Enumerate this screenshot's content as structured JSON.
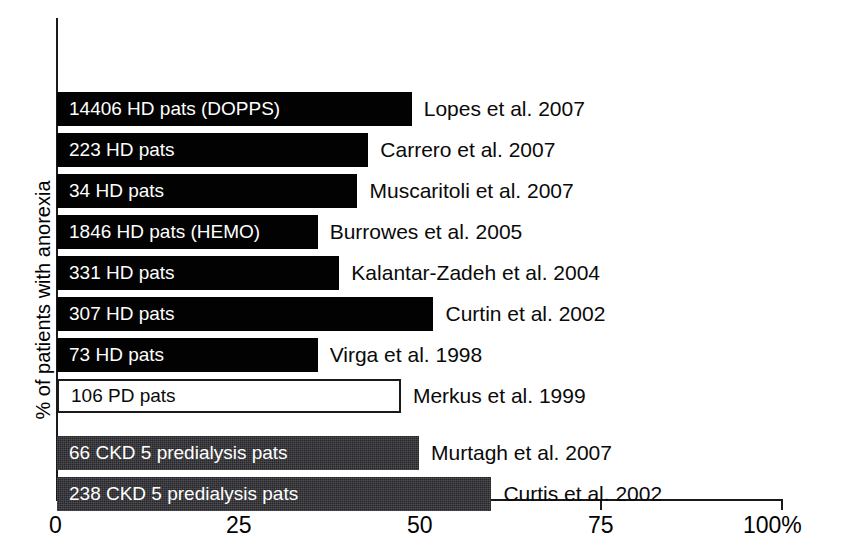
{
  "chart_data": {
    "type": "bar",
    "orientation": "horizontal",
    "title": "",
    "subtitle": "",
    "xlabel": "",
    "ylabel": "% of patients with anorexia",
    "xlim": [
      0,
      100
    ],
    "xticks": [
      0,
      25,
      50,
      75,
      100
    ],
    "xtick_labels": [
      "0",
      "25",
      "50",
      "75",
      "100%"
    ],
    "grid": false,
    "legend": "none",
    "categories": [
      "Lopes et al. 2007",
      "Carrero et al. 2007",
      "Muscaritoli et al. 2007",
      "Burrowes et al. 2005",
      "Kalantar-Zadeh et al. 2004",
      "Curtin et al. 2002",
      "Virga et al. 1998",
      "Merkus et al. 1999",
      "Murtagh et al. 2007",
      "Curtis et al. 2002"
    ],
    "values": [
      49,
      43,
      41.5,
      36,
      39,
      52,
      36,
      47.5,
      50,
      60
    ],
    "annotations": [
      "14406 HD pats (DOPPS)",
      "223 HD pats",
      "34 HD pats",
      "1846 HD pats (HEMO)",
      "331 HD pats",
      "307 HD pats",
      "73 HD pats",
      "106 PD pats",
      "66 CKD 5 predialysis pats",
      "238 CKD 5 predialysis pats"
    ]
  },
  "axis": {
    "y_title": "% of patients with anorexia",
    "x_tick_labels": [
      "0",
      "25",
      "50",
      "75",
      "100%"
    ]
  },
  "bars": [
    {
      "inner_label": "14406 HD pats (DOPPS)",
      "series_label": "Lopes et al. 2007",
      "value": 49,
      "style": "solid-black",
      "label_color": "on-dark"
    },
    {
      "inner_label": "223 HD pats",
      "series_label": "Carrero et al. 2007",
      "value": 43,
      "style": "solid-black",
      "label_color": "on-dark"
    },
    {
      "inner_label": "34 HD pats",
      "series_label": "Muscaritoli et al. 2007",
      "value": 41.5,
      "style": "solid-black",
      "label_color": "on-dark"
    },
    {
      "inner_label": "1846 HD pats (HEMO)",
      "series_label": "Burrowes et al. 2005",
      "value": 36,
      "style": "solid-black",
      "label_color": "on-dark"
    },
    {
      "inner_label": "331 HD pats",
      "series_label": "Kalantar-Zadeh et al. 2004",
      "value": 39,
      "style": "solid-black",
      "label_color": "on-dark"
    },
    {
      "inner_label": "307 HD pats",
      "series_label": "Curtin et al. 2002",
      "value": 52,
      "style": "solid-black",
      "label_color": "on-dark"
    },
    {
      "inner_label": "73 HD pats",
      "series_label": "Virga et al. 1998",
      "value": 36,
      "style": "solid-black",
      "label_color": "on-dark"
    },
    {
      "inner_label": "106 PD pats",
      "series_label": "Merkus et al. 1999",
      "value": 47.5,
      "style": "outline",
      "label_color": "on-light"
    },
    {
      "inner_label": "66 CKD 5 predialysis pats",
      "series_label": "Murtagh et al. 2007",
      "value": 50,
      "style": "dark-textured",
      "label_color": "on-dark"
    },
    {
      "inner_label": "238 CKD 5 predialysis pats",
      "series_label": "Curtis et al. 2002",
      "value": 60,
      "style": "dark-textured",
      "label_color": "on-dark"
    }
  ],
  "colors": {
    "bar_black": "#020202",
    "bar_dark_textured": "#26262a",
    "bar_outline_fill": "#ffffff",
    "axis": "#1a1a1a",
    "background": "#ffffff"
  }
}
